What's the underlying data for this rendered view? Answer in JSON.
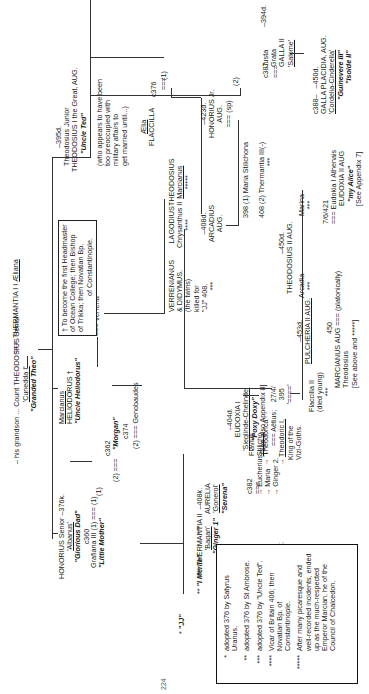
{
  "diagram": {
    "type": "family-tree",
    "orientation": "rotated-90-ccw",
    "header": "– his grandson ... Count THEODOSIUS Senior",
    "root": {
      "name": "Count THEODOSIUS Senior",
      "alias": "'Cunedda I'",
      "nickname": "\"Granded Theo\"",
      "marriage": "===",
      "spouse": "THERMANTIA I",
      "spouse_alias": "Ælianа"
    },
    "children_gen1": {
      "honorius_senior": {
        "name": "HONORIUS Senior",
        "death": "–376k.",
        "alias": "'Albanus'",
        "nickname": "\"Glorious Dad\"",
        "marriage1_year": "c360",
        "marriage1_label": "(1)",
        "marriage2_label": "(2)",
        "marriage2_year": "c362",
        "eq": "==="
      },
      "grafiana": {
        "name": "Grafiana III (1)",
        "eq": "===",
        "marriage_label": "(1)",
        "nickname": "\"Little Mother\""
      },
      "morgan": {
        "nickname": "\"Morgan\"",
        "year": "c374",
        "marriage_label": "(2)",
        "eq": "===",
        "spouse": "Genobaudes"
      },
      "marcianus": {
        "alias": "Marcianus",
        "name": "HELIODORUS †",
        "nickname": "\"Uncle Heliodorus\"",
        "eq": "===",
        "spouse": "Verrena"
      },
      "theodosius_junior": {
        "death": "–395d.",
        "name": "Theodosius Junior",
        "title": "THEODOSIUS I the Great, AUG.",
        "nickname": "\"Uncle Ted\"",
        "note": [
          "(who appears to have been",
          "too preoccupied with",
          "military affairs to",
          "get married until...)"
        ]
      },
      "flaccilla": {
        "alias": "Ælia",
        "name": "FLACCILLA",
        "year": "c376",
        "eq": "===",
        "marriage_label": "(1)"
      },
      "galla": {
        "death": "–394d.",
        "parents": "Justa",
        "name1": "Grata",
        "name": "GALLA II",
        "alias": "'Salome'",
        "year": "c387",
        "marriage_label": "(2)",
        "eq": "==="
      },
      "galla_placidia": {
        "birth": "c388–",
        "death": "–450d.",
        "name": "GALLA PLACIDIA, AUG.",
        "alias": "'Cordelia-Cinderella'",
        "nickname1": "\"Guinevere III\"",
        "nickname2": "\"Isolde II\""
      }
    },
    "heliodorus_note": [
      "† To become the first Headmaster",
      "of Ocean College; then Bishop",
      "of Trikka; then Novatian Bp.",
      "of Constantinople."
    ],
    "verrena_children": [
      {
        "name": "VERRENIANUS",
        "line2": "& DIDYMUS,",
        "line3": "(the twins)",
        "line4": "killed for",
        "line5": "\"JJ\" 408.",
        "stars": "***"
      },
      {
        "name": "LAGODIUS",
        "line2": "Chrysanthus II",
        "stars": "****"
      },
      {
        "name": "THEODOSIUS",
        "line2": "Marcianus",
        "stars": "*****"
      }
    ],
    "honorius_children": {
      "jj": {
        "stars": "*",
        "nickname": "\"JJ\""
      },
      "merlin": {
        "stars": "**",
        "nickname": "\"I Merlin\""
      },
      "thermantia2": {
        "stars_left": "***",
        "name": "THERMANTIA II",
        "alias": "'Bagan'",
        "nickname": "\"Ginger 1\"",
        "stars_right": "***"
      },
      "aurelia": {
        "death": "–408k.",
        "name": "AURELIA",
        "alias": "'Gonerol'",
        "nickname": "\"Serena\""
      },
      "eudoxia": {
        "death": "–404d.",
        "name": "EUDOXIA I",
        "alias": "'Sieglinde-Chelinde'",
        "nickname": "\"Poxy Doxy\"",
        "note": "[See also Appendix 8]"
      }
    },
    "seuso": {
      "year": "c382",
      "eq": "===",
      "name": "'SEUSO'",
      "alias": "Alaric",
      "children": [
        "sons &",
        "daughters;",
        "including,"
      ],
      "theodorica": "'Theodorica'",
      "theodorica_eq": "=== Aëtius;",
      "theodoric": "Theodoric I,",
      "theodoric_title": [
        "King of the",
        "Vizi-Goths."
      ]
    },
    "stilicho": {
      "year": "c382",
      "eq": "===",
      "name1": "Flavius",
      "name": "Stilicho",
      "children": [
        "Eucherius",
        "Maria",
        "Ginger 2."
      ]
    },
    "arcadius_line": {
      "marriage_date": "27/4/",
      "marriage_year": "395",
      "eq": "'===='",
      "arcadius": {
        "death": "–408d.",
        "name": "ARCADIUS",
        "title": "AUG."
      },
      "honorius_jr": {
        "death": "–423d.",
        "name": "HONORIUS Jr.",
        "title": "AUG.",
        "eq": "=== (sp)",
        "spouses": [
          {
            "year": "398",
            "label": "(1)",
            "name": "Maria Stilichona"
          },
          {
            "year": "408",
            "label": "(2)",
            "name": "Thermantia III(-)",
            "stars": "***"
          }
        ]
      }
    },
    "arcadius_children": [
      {
        "name": "Flaccilla II",
        "note": "(died young)",
        "stars": "***"
      },
      {
        "death": "–453d.",
        "name": "PULCHERIA II AUG."
      },
      {
        "name": "Arcadia",
        "stars": "***"
      },
      {
        "death": "–450d.",
        "name": "THEODOSIUS II AUG."
      },
      {
        "name": "Marina",
        "stars": "***"
      }
    ],
    "pulcheria_marriage": {
      "year": "450",
      "eq": "===",
      "note": "(platonically)",
      "spouse": "MARCIANUS AUG",
      "spouse2": "Theodosius",
      "ref": "[See above and *****]"
    },
    "theodosius2_marriage": {
      "date": "7/6/421",
      "eq": "===",
      "spouse": "Eudokia I Athenais",
      "spouse_title": "EUDOXIA II AUG",
      "nickname": "\"my Alice\"",
      "ref": "[See Appendix 7]"
    },
    "legend": [
      {
        "stars": "*",
        "text": "adopted 376 by Satyrus Uranus."
      },
      {
        "stars": "**",
        "text": "adopted 376 by St Ambrose."
      },
      {
        "stars": "***",
        "text": "adopted 376 by \"Uncle Ted\"."
      },
      {
        "stars": "****",
        "text": "Vicar of Britain 406; then Novatian Bp. of Constantinople."
      },
      {
        "stars": "*****",
        "text": "After many picaresque and well-recorded incidents, ended up as the much-respected Emperor Marcian, he of the Council of Chalcedon."
      }
    ],
    "page_number": "224"
  }
}
